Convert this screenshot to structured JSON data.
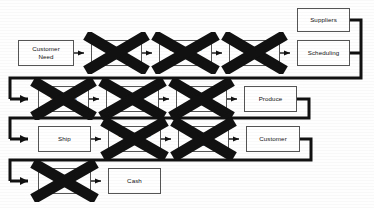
{
  "diagram": {
    "type": "process-flow",
    "accent_color": "#111111",
    "box_border_color": "#555555",
    "connector_color": "#111111",
    "rows": [
      {
        "id": "row-1",
        "nodes": [
          {
            "id": "customer-need",
            "label": "Customer\nNeed",
            "crossed_out": false,
            "x": 18,
            "y": 40,
            "w": 56,
            "h": 26
          },
          {
            "id": "order-1",
            "label": "Order",
            "crossed_out": true,
            "x": 91,
            "y": 40,
            "w": 51,
            "h": 26
          },
          {
            "id": "distribution-entity",
            "label": "Distribution\nEntity",
            "crossed_out": true,
            "x": 159,
            "y": 40,
            "w": 53,
            "h": 26
          },
          {
            "id": "order-2",
            "label": "Order",
            "crossed_out": true,
            "x": 229,
            "y": 40,
            "w": 51,
            "h": 26
          },
          {
            "id": "scheduling",
            "label": "Scheduling",
            "crossed_out": false,
            "x": 297,
            "y": 40,
            "w": 53,
            "h": 26
          },
          {
            "id": "suppliers-top",
            "label": "Suppliers",
            "crossed_out": false,
            "x": 297,
            "y": 8,
            "w": 53,
            "h": 24
          }
        ]
      },
      {
        "id": "row-2",
        "nodes": [
          {
            "id": "suppliers-row2",
            "label": "Suppliers",
            "crossed_out": true,
            "x": 38,
            "y": 86,
            "w": 51,
            "h": 26
          },
          {
            "id": "receiving-inspection",
            "label": "Receiving\nInspection",
            "crossed_out": true,
            "x": 106,
            "y": 86,
            "w": 53,
            "h": 26
          },
          {
            "id": "store",
            "label": "Store",
            "crossed_out": true,
            "x": 176,
            "y": 86,
            "w": 51,
            "h": 26
          },
          {
            "id": "produce",
            "label": "Produce",
            "crossed_out": false,
            "x": 244,
            "y": 86,
            "w": 53,
            "h": 26
          }
        ]
      },
      {
        "id": "row-3",
        "nodes": [
          {
            "id": "ship",
            "label": "Ship",
            "crossed_out": false,
            "x": 38,
            "y": 126,
            "w": 53,
            "h": 26
          },
          {
            "id": "distribution-center",
            "label": "Distribution\nCenter",
            "crossed_out": true,
            "x": 108,
            "y": 126,
            "w": 53,
            "h": 26
          },
          {
            "id": "delivery",
            "label": "Deliver\ny",
            "crossed_out": true,
            "x": 178,
            "y": 126,
            "w": 51,
            "h": 26
          },
          {
            "id": "customer",
            "label": "Customer",
            "crossed_out": false,
            "x": 246,
            "y": 126,
            "w": 54,
            "h": 26
          }
        ]
      },
      {
        "id": "row-4",
        "nodes": [
          {
            "id": "invoice",
            "label": "Invoice",
            "crossed_out": true,
            "x": 38,
            "y": 168,
            "w": 53,
            "h": 26
          },
          {
            "id": "cash",
            "label": "Cash",
            "crossed_out": false,
            "x": 108,
            "y": 168,
            "w": 53,
            "h": 26
          }
        ]
      }
    ],
    "crossed_out_count": 7,
    "legend_note": ""
  }
}
